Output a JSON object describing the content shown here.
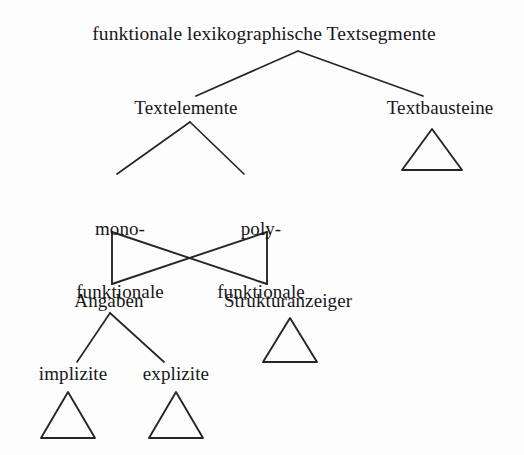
{
  "diagram": {
    "type": "tree",
    "title_visible": false,
    "background_color": "#fdfdfd",
    "line_color": "#26262a",
    "text_color": "#17171a",
    "nodes": {
      "root": "funktionale lexikographische Textsegmente",
      "level1": {
        "left": "Textelemente",
        "right": "Textbausteine"
      },
      "level2": {
        "left_line1": "mono-",
        "left_line2": "funktionale",
        "right_line1": "poly-",
        "right_line2": "funktionale"
      },
      "level3": {
        "left": "Angaben",
        "right": "Strukturanzeiger"
      },
      "level4": {
        "left": "implizite",
        "right": "explizite"
      }
    },
    "triangles": [
      {
        "name": "textbausteine-triangle",
        "cx": 432,
        "top_y": 129,
        "base_y": 170,
        "half_width": 30
      },
      {
        "name": "strukturanzeiger-triangle",
        "cx": 290,
        "top_y": 318,
        "base_y": 362,
        "half_width": 27
      },
      {
        "name": "implizite-triangle",
        "cx": 68,
        "top_y": 392,
        "base_y": 438,
        "half_width": 27
      },
      {
        "name": "explizite-triangle",
        "cx": 176,
        "top_y": 392,
        "base_y": 438,
        "half_width": 27
      }
    ],
    "edges": [
      {
        "name": "root-to-textelemente",
        "x1": 298,
        "y1": 51,
        "x2": 196,
        "y2": 96
      },
      {
        "name": "root-to-textbausteine",
        "x1": 298,
        "y1": 51,
        "x2": 422,
        "y2": 96
      },
      {
        "name": "textelemente-to-mono",
        "x1": 190,
        "y1": 122,
        "x2": 118,
        "y2": 173
      },
      {
        "name": "textelemente-to-poly",
        "x1": 190,
        "y1": 122,
        "x2": 243,
        "y2": 173
      },
      {
        "name": "angaben-to-implizite",
        "x1": 110,
        "y1": 313,
        "x2": 78,
        "y2": 361
      },
      {
        "name": "angaben-to-explizite",
        "x1": 110,
        "y1": 313,
        "x2": 163,
        "y2": 361
      }
    ],
    "bowtie": {
      "name": "crossing-bowtie",
      "left_x": 112,
      "right_x": 267,
      "top_y": 232,
      "bottom_y": 284,
      "description": "mono-funktionale and poly-funktionale cross to Angaben and Strukturanzeiger"
    }
  }
}
